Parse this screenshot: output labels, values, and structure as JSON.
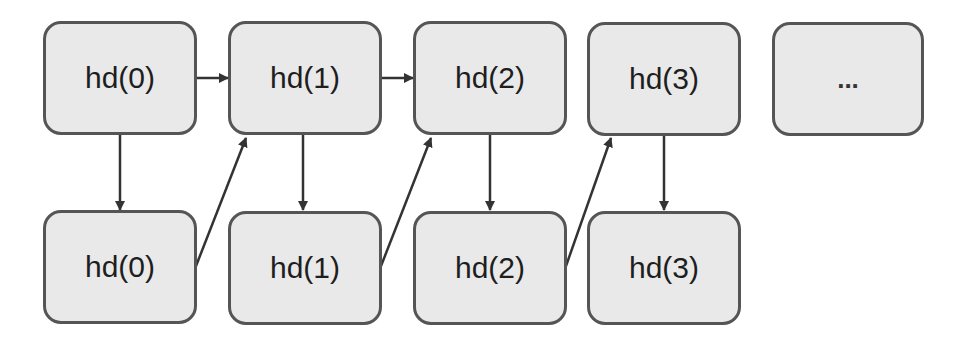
{
  "diagram": {
    "type": "flow",
    "top_row": [
      {
        "id": "top0",
        "label": "hd(0)"
      },
      {
        "id": "top1",
        "label": "hd(1)"
      },
      {
        "id": "top2",
        "label": "hd(2)"
      },
      {
        "id": "top3",
        "label": "hd(3)"
      },
      {
        "id": "top4",
        "label": "..."
      }
    ],
    "bottom_row": [
      {
        "id": "bot0",
        "label": "hd(0)"
      },
      {
        "id": "bot1",
        "label": "hd(1)"
      },
      {
        "id": "bot2",
        "label": "hd(2)"
      },
      {
        "id": "bot3",
        "label": "hd(3)"
      }
    ],
    "edges": [
      {
        "from": "top0",
        "to": "top1"
      },
      {
        "from": "top1",
        "to": "top2"
      },
      {
        "from": "top0",
        "to": "bot0"
      },
      {
        "from": "top1",
        "to": "bot1"
      },
      {
        "from": "top2",
        "to": "bot2"
      },
      {
        "from": "top3",
        "to": "bot3"
      },
      {
        "from": "bot0",
        "to": "top1"
      },
      {
        "from": "bot1",
        "to": "top2"
      },
      {
        "from": "bot2",
        "to": "top3"
      }
    ],
    "colors": {
      "node_fill": "#e9e9e9",
      "node_border": "#555555",
      "edge": "#333333"
    }
  }
}
